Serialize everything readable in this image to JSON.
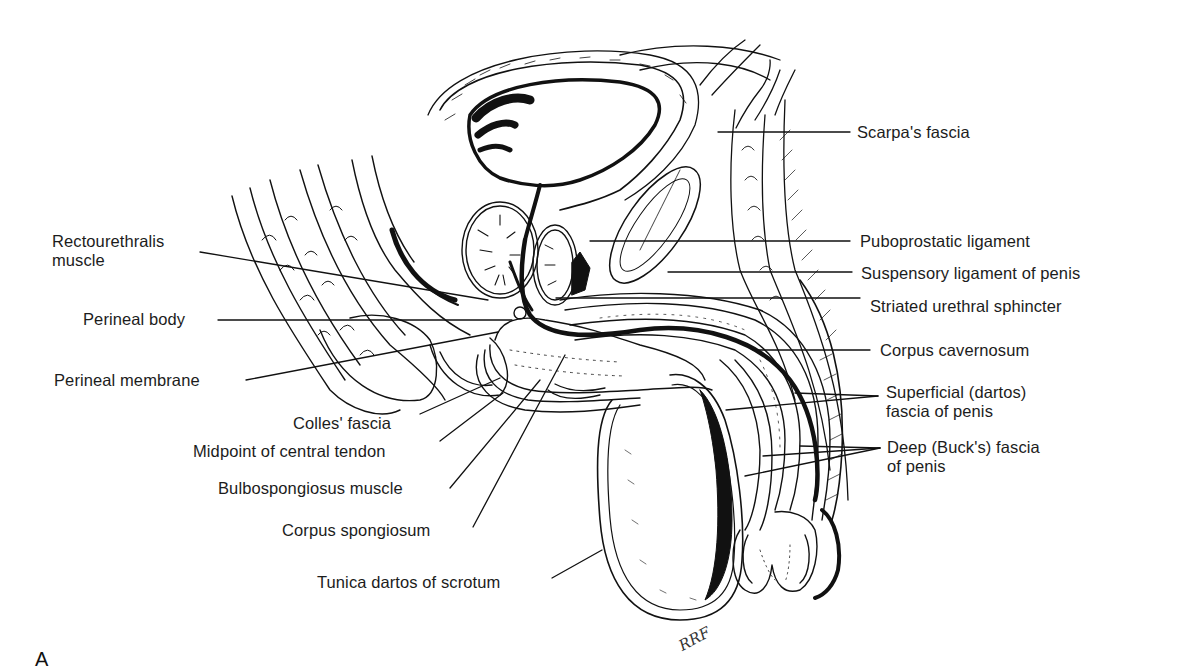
{
  "figure": {
    "panel_letter": "A",
    "signature": "RRF",
    "labels_left": [
      {
        "id": "rectourethralis",
        "text": "Rectourethralis\nmuscle"
      },
      {
        "id": "perineal-body",
        "text": "Perineal body"
      },
      {
        "id": "perineal-membrane",
        "text": "Perineal membrane"
      },
      {
        "id": "colles-fascia",
        "text": "Colles' fascia"
      },
      {
        "id": "midpoint-central-tendon",
        "text": "Midpoint of central tendon"
      },
      {
        "id": "bulbospongiosus",
        "text": "Bulbospongiosus muscle"
      },
      {
        "id": "corpus-spongiosum",
        "text": "Corpus spongiosum"
      },
      {
        "id": "tunica-dartos",
        "text": "Tunica dartos of scrotum"
      }
    ],
    "labels_right": [
      {
        "id": "scarpas-fascia",
        "text": "Scarpa's fascia"
      },
      {
        "id": "puboprostatic-ligament",
        "text": "Puboprostatic ligament"
      },
      {
        "id": "suspensory-ligament",
        "text": "Suspensory ligament of penis"
      },
      {
        "id": "striated-urethral-sphincter",
        "text": "Striated urethral sphincter"
      },
      {
        "id": "corpus-cavernosum",
        "text": "Corpus cavernosum"
      },
      {
        "id": "superficial-dartos-fascia",
        "text": "Superficial (dartos)\nfascia of penis"
      },
      {
        "id": "deep-bucks-fascia",
        "text": "Deep (Buck's) fascia\nof penis"
      }
    ]
  },
  "colors": {
    "ink": "#111111",
    "background": "#ffffff"
  }
}
